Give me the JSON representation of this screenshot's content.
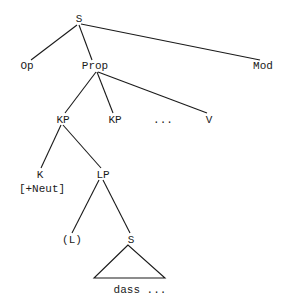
{
  "diagram": {
    "type": "syntax-tree",
    "colors": {
      "ink": "#1a1a1a",
      "background": "#ffffff"
    },
    "nodes": [
      {
        "id": "s_root",
        "label": "S"
      },
      {
        "id": "op",
        "label": "Op"
      },
      {
        "id": "prop",
        "label": "Prop"
      },
      {
        "id": "mod",
        "label": "Mod"
      },
      {
        "id": "kp1",
        "label": "KP"
      },
      {
        "id": "kp2",
        "label": "KP"
      },
      {
        "id": "ellipsis",
        "label": "..."
      },
      {
        "id": "v",
        "label": "V"
      },
      {
        "id": "k",
        "label": "K"
      },
      {
        "id": "k_feature",
        "label": "[+Neut]"
      },
      {
        "id": "lp",
        "label": "LP"
      },
      {
        "id": "l_opt",
        "label": "(L)"
      },
      {
        "id": "s_embedded",
        "label": "S"
      },
      {
        "id": "dass_text",
        "label": "dass ..."
      }
    ],
    "edges": [
      {
        "from": "s_root",
        "to": "op"
      },
      {
        "from": "s_root",
        "to": "prop"
      },
      {
        "from": "s_root",
        "to": "mod"
      },
      {
        "from": "prop",
        "to": "kp1"
      },
      {
        "from": "prop",
        "to": "kp2"
      },
      {
        "from": "prop",
        "to": "v"
      },
      {
        "from": "kp1",
        "to": "k"
      },
      {
        "from": "kp1",
        "to": "lp"
      },
      {
        "from": "lp",
        "to": "l_opt"
      },
      {
        "from": "lp",
        "to": "s_embedded"
      }
    ],
    "triangles": [
      {
        "under": "s_embedded",
        "content": "dass_text"
      }
    ]
  }
}
